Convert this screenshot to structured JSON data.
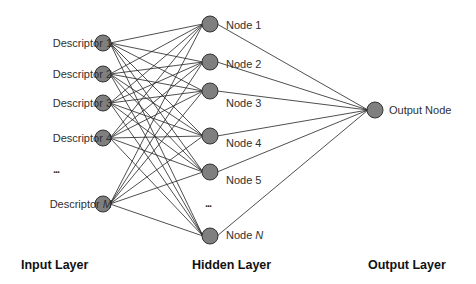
{
  "diagram": {
    "type": "neural-network",
    "colors": {
      "node_fill": "#7f7f7f",
      "node_stroke": "#333333",
      "edge": "#222222",
      "text": "#303030"
    },
    "input_layer": {
      "title": "Input Layer",
      "nodes": [
        {
          "label": "Descriptor 1",
          "y": 43
        },
        {
          "label": "Descriptor 2",
          "y": 74
        },
        {
          "label": "Descriptor 3",
          "y": 103
        },
        {
          "label": "Descriptor 4",
          "y": 138
        },
        {
          "label_prefix": "Descriptor ",
          "label_var": "M",
          "y": 204
        }
      ],
      "ellipsis": "..."
    },
    "hidden_layer": {
      "title": "Hidden Layer",
      "nodes": [
        {
          "label": "Node 1",
          "y": 24
        },
        {
          "label": "Node 2",
          "y": 62
        },
        {
          "label": "Node 3",
          "y": 91
        },
        {
          "label": "Node 4",
          "y": 136
        },
        {
          "label": "Node 5",
          "y": 172
        },
        {
          "label_prefix": "Node ",
          "label_var": "N",
          "y": 236
        }
      ],
      "ellipsis": "..."
    },
    "output_layer": {
      "title": "Output Layer",
      "nodes": [
        {
          "label": "Output Node",
          "y": 110
        }
      ]
    }
  }
}
